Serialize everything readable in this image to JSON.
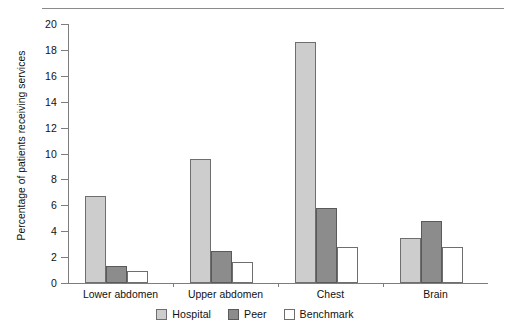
{
  "chart_data": {
    "type": "bar",
    "title": "",
    "subtitle": "",
    "xlabel": "",
    "ylabel": "Percentage of patients receiving services",
    "categories": [
      "Lower abdomen",
      "Upper abdomen",
      "Chest",
      "Brain"
    ],
    "series": [
      {
        "name": "Hospital",
        "color": "#cdcdcd",
        "values": [
          6.7,
          9.6,
          18.6,
          3.5
        ]
      },
      {
        "name": "Peer",
        "color": "#8c8c8c",
        "values": [
          1.3,
          2.5,
          5.8,
          4.8
        ]
      },
      {
        "name": "Benchmark",
        "color": "#ffffff",
        "values": [
          0.9,
          1.6,
          2.8,
          2.8
        ]
      }
    ],
    "ylim": [
      0,
      20
    ],
    "yticks": [
      0,
      2,
      4,
      6,
      8,
      10,
      12,
      14,
      16,
      18,
      20
    ],
    "ytick_labels": [
      "0",
      "2",
      "4",
      "6",
      "8",
      "10",
      "12",
      "14",
      "16",
      "18",
      "20"
    ],
    "grid": false,
    "legend_position": "bottom",
    "legend": [
      "Hospital",
      "Peer",
      "Benchmark"
    ],
    "annotations": []
  },
  "figure": {
    "top_rule": true,
    "background": "#ffffff",
    "axis_color": "#7d7d7d",
    "text_color": "#111111"
  }
}
